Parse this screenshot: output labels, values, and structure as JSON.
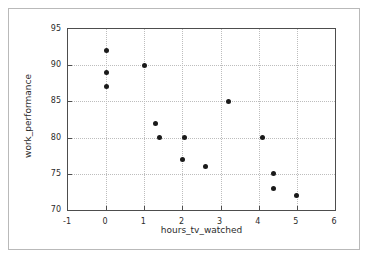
{
  "chart_data": {
    "type": "scatter",
    "title": "",
    "xlabel": "hours_tv_watched",
    "ylabel": "work_performance",
    "xlim": [
      -1,
      6
    ],
    "ylim": [
      70,
      95
    ],
    "xticks": [
      -1,
      0,
      1,
      2,
      3,
      4,
      5,
      6
    ],
    "yticks": [
      70,
      75,
      80,
      85,
      90,
      95
    ],
    "xtick_labels": [
      "-1",
      "0",
      "1",
      "2",
      "3",
      "4",
      "5",
      "6"
    ],
    "ytick_labels": [
      "70",
      "75",
      "80",
      "85",
      "90",
      "95"
    ],
    "grid": true,
    "legend": null,
    "marker_color": "#1a1a1a",
    "points": [
      {
        "x": 0.0,
        "y": 92
      },
      {
        "x": 0.0,
        "y": 89
      },
      {
        "x": 0.0,
        "y": 87
      },
      {
        "x": 1.0,
        "y": 90
      },
      {
        "x": 1.3,
        "y": 82
      },
      {
        "x": 1.4,
        "y": 80
      },
      {
        "x": 2.05,
        "y": 80
      },
      {
        "x": 2.0,
        "y": 77
      },
      {
        "x": 2.6,
        "y": 76
      },
      {
        "x": 3.2,
        "y": 85
      },
      {
        "x": 4.1,
        "y": 80
      },
      {
        "x": 4.4,
        "y": 75
      },
      {
        "x": 4.4,
        "y": 73
      },
      {
        "x": 5.0,
        "y": 72
      }
    ]
  },
  "figure": {
    "background_color": "#ffffff",
    "border_color": "#b9b9b9",
    "axes_color": "#4d4d4d",
    "grid_color": "#bdbdbd"
  }
}
